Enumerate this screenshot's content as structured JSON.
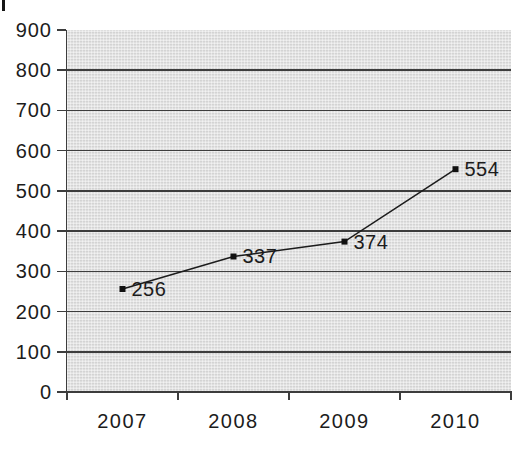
{
  "chart_data": {
    "type": "line",
    "title": "",
    "xlabel": "",
    "ylabel": "",
    "categories": [
      "2007",
      "2008",
      "2009",
      "2010"
    ],
    "series": [
      {
        "name": "values",
        "values": [
          256,
          337,
          374,
          554
        ]
      }
    ],
    "point_labels": [
      "256",
      "337",
      "374",
      "554"
    ],
    "ylim": [
      0,
      900
    ],
    "ytick_step": 100,
    "y_tick_labels": [
      "0",
      "100",
      "200",
      "300",
      "400",
      "500",
      "600",
      "700",
      "800",
      "900"
    ],
    "grid": true,
    "gridlines_at": [
      100,
      200,
      300,
      400,
      500,
      600,
      700,
      800
    ],
    "legend": "none",
    "marker": "filled-square",
    "colors": {
      "line": "#1c1c1c",
      "marker": "#111111",
      "grid": "#3d3d3d",
      "axis": "#3d3d3d",
      "text": "#1c1c1c",
      "plot_bg": "#dedede",
      "page_bg": "#ffffff"
    }
  }
}
